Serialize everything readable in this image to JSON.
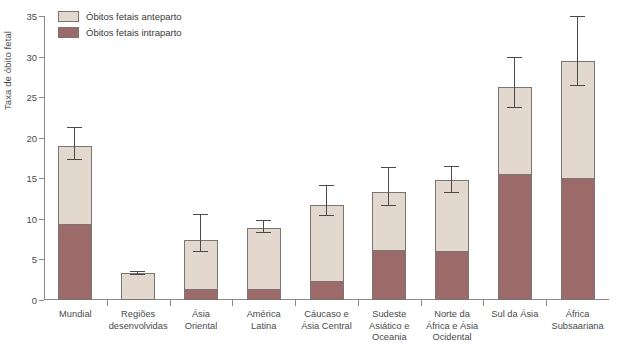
{
  "chart_data": {
    "type": "bar",
    "subtype": "stacked-bar-with-error-bars",
    "title": "",
    "xlabel": "",
    "ylabel": "Taxa de óbito fetal",
    "ylim": [
      0,
      35
    ],
    "yticks": [
      0,
      5,
      10,
      15,
      20,
      25,
      30,
      35
    ],
    "grid": false,
    "legend_position": "top-left",
    "categories": [
      "Mundial",
      "Regiões desenvolvidas",
      "Ásia Oriental",
      "América Latina",
      "Cáucaso e Ásia Central",
      "Sudeste Asiático e Oceania",
      "Norte da África e Ásia Ocidental",
      "Sul da Ásia",
      "África Subsaariana"
    ],
    "category_lines": [
      [
        "Mundial"
      ],
      [
        "Regiões",
        "desenvolvidas"
      ],
      [
        "Ásia",
        "Oriental"
      ],
      [
        "América",
        "Latina"
      ],
      [
        "Cáucaso e",
        "Ásia Central"
      ],
      [
        "Sudeste",
        "Asiático e",
        "Oceania"
      ],
      [
        "Norte da",
        "África e Ásia",
        "Ocidental"
      ],
      [
        "Sul da Ásia"
      ],
      [
        "África",
        "Subsaariana"
      ]
    ],
    "series": [
      {
        "name": "Óbitos fetais intraparto",
        "color": "#9d6a6a",
        "values": [
          9.5,
          0.3,
          1.5,
          1.5,
          2.5,
          6.3,
          6.2,
          15.7,
          15.2
        ]
      },
      {
        "name": "Óbitos fetais anteparto",
        "color": "#e2d8ce",
        "values": [
          9.5,
          3.0,
          5.9,
          7.4,
          9.2,
          7.0,
          8.6,
          10.6,
          14.2
        ]
      }
    ],
    "totals": [
      19.0,
      3.3,
      7.4,
      8.9,
      11.7,
      13.3,
      14.8,
      26.3,
      29.4
    ],
    "error_bars": {
      "lower": [
        17.3,
        3.1,
        5.9,
        8.2,
        10.4,
        11.6,
        13.2,
        23.7,
        26.4
      ],
      "upper": [
        21.2,
        3.5,
        10.5,
        9.7,
        14.1,
        16.3,
        16.4,
        29.8,
        34.9
      ]
    }
  },
  "legend": {
    "items": [
      {
        "label": "Óbitos fetais anteparto",
        "color": "#e2d8ce"
      },
      {
        "label": "Óbitos fetais intraparto",
        "color": "#9d6a6a"
      }
    ]
  },
  "axis": {
    "y_title": "Taxa de óbito fetal",
    "y_tick_labels": [
      "0",
      "5",
      "10",
      "15",
      "20",
      "25",
      "30",
      "35"
    ]
  }
}
